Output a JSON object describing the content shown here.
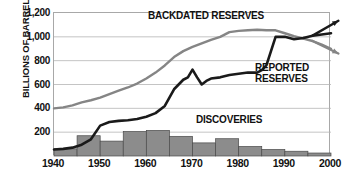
{
  "chart_data": {
    "type": "line",
    "title": "",
    "xlabel": "",
    "ylabel": "BILLIONS OF BARRELS",
    "xlim": [
      1940,
      2000
    ],
    "ylim": [
      0,
      1200
    ],
    "grid": true,
    "legend_position": "inline-annotations",
    "x_ticks": [
      "1940",
      "1950",
      "1960",
      "1970",
      "1980",
      "1990",
      "2000"
    ],
    "x_tick_values": [
      1940,
      1950,
      1960,
      1970,
      1980,
      1990,
      2000
    ],
    "y_ticks": [
      "200",
      "400",
      "600",
      "800",
      "1,000",
      "1,200"
    ],
    "y_tick_values": [
      200,
      400,
      600,
      800,
      1000,
      1200
    ],
    "annotations": [
      {
        "name": "backdated-arrow",
        "text": "",
        "note": "arrow head at right edge pointing up-right on backdated/reported crossing"
      },
      {
        "name": "reported-arrow",
        "text": "",
        "note": "arrow head at right edge pointing down-right"
      }
    ],
    "series": [
      {
        "name": "BACKDATED RESERVES",
        "type": "line",
        "color": "#858585",
        "x": [
          1940,
          1942,
          1944,
          1946,
          1948,
          1950,
          1952,
          1954,
          1956,
          1958,
          1960,
          1962,
          1964,
          1966,
          1968,
          1970,
          1972,
          1974,
          1976,
          1978,
          1980,
          1982,
          1984,
          1986,
          1988,
          1990,
          1992,
          1994,
          1996,
          1998,
          2000
        ],
        "values": [
          400,
          408,
          425,
          450,
          468,
          490,
          520,
          548,
          575,
          608,
          650,
          700,
          760,
          830,
          880,
          915,
          945,
          975,
          1000,
          1040,
          1050,
          1055,
          1060,
          1055,
          1055,
          1030,
          1005,
          985,
          965,
          935,
          900
        ]
      },
      {
        "name": "REPORTED RESERVES",
        "type": "line",
        "color": "#1a1a1a",
        "x": [
          1940,
          1942,
          1944,
          1946,
          1948,
          1950,
          1952,
          1954,
          1956,
          1958,
          1960,
          1962,
          1964,
          1966,
          1968,
          1969,
          1970,
          1971,
          1972,
          1973,
          1974,
          1976,
          1978,
          1980,
          1982,
          1984,
          1985,
          1986,
          1987,
          1988,
          1990,
          1992,
          1994,
          1996,
          1998,
          2000
        ],
        "values": [
          55,
          60,
          70,
          95,
          140,
          255,
          285,
          295,
          300,
          310,
          330,
          360,
          420,
          560,
          640,
          660,
          725,
          660,
          600,
          630,
          650,
          660,
          680,
          690,
          700,
          700,
          720,
          760,
          880,
          1000,
          1000,
          980,
          990,
          1010,
          1020,
          1030
        ]
      },
      {
        "name": "DISCOVERIES",
        "type": "bar",
        "color": "#8c8c8c",
        "bar_start_years": [
          1940,
          1945,
          1950,
          1955,
          1960,
          1965,
          1970,
          1975,
          1980,
          1985,
          1990,
          1995
        ],
        "bar_width_years": 5,
        "categories": [
          "1940-45",
          "1945-50",
          "1950-55",
          "1955-60",
          "1960-65",
          "1965-70",
          "1970-75",
          "1975-80",
          "1980-85",
          "1985-90",
          "1990-95",
          "1995-2000"
        ],
        "values": [
          60,
          170,
          125,
          205,
          215,
          165,
          110,
          145,
          80,
          55,
          40,
          25
        ]
      }
    ]
  },
  "axes": {
    "y_title": "BILLIONS OF BARRELS",
    "y_tick_labels": [
      "1,200",
      "1,000",
      "800",
      "600",
      "400",
      "200"
    ],
    "x_tick_labels": [
      "1940",
      "1950",
      "1960",
      "1970",
      "1980",
      "1990",
      "2000"
    ]
  },
  "labels": {
    "backdated": "BACKDATED RESERVES",
    "reported_line1": "REPORTED",
    "reported_line2": "RESERVES",
    "discoveries": "DISCOVERIES"
  },
  "colors": {
    "backdated_line": "#858585",
    "reported_line": "#1a1a1a",
    "bar_fill": "#8c8c8c",
    "bar_stroke": "#4a4a4a",
    "grid": "#b5b5b5",
    "frame": "#a8a8a8",
    "text": "#111111",
    "background": "#ffffff"
  }
}
